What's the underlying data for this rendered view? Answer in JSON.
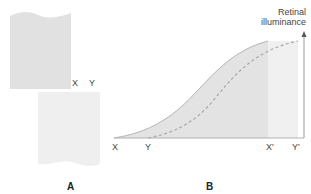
{
  "panel_a": {
    "label": "A",
    "edge_labels": {
      "x": "X",
      "y": "Y"
    }
  },
  "panel_b": {
    "label": "B",
    "axis_title_line1": "Retinal",
    "axis_title_line2": "illuminance",
    "x_labels": {
      "x": "X",
      "y": "Y",
      "x_prime": "X'",
      "y_prime": "Y'"
    }
  },
  "colors": {
    "top_sheet": "#e1e1e1",
    "bottom_sheet": "#efefef",
    "shaded_region": "#e3e3e3",
    "light_region": "#f0f0f0",
    "curve_stroke": "#b5b5b5",
    "dashed_curve": "#a8a8a8",
    "axis": "#9a9a9a"
  }
}
